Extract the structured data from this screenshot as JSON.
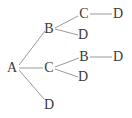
{
  "diagram": {
    "type": "tree",
    "root": "A",
    "colors": {
      "edge": "#9a9a9a",
      "label": "#3a3a3a",
      "background": "#ffffff"
    },
    "nodes": [
      {
        "id": "n_A",
        "label": "A",
        "x": 12,
        "y": 68
      },
      {
        "id": "n_AB",
        "label": "B",
        "x": 49,
        "y": 29
      },
      {
        "id": "n_AC",
        "label": "C",
        "x": 49,
        "y": 68
      },
      {
        "id": "n_AD",
        "label": "D",
        "x": 49,
        "y": 105
      },
      {
        "id": "n_ABC",
        "label": "C",
        "x": 84,
        "y": 14
      },
      {
        "id": "n_ABD",
        "label": "D",
        "x": 83,
        "y": 35
      },
      {
        "id": "n_ACB",
        "label": "B",
        "x": 84,
        "y": 57
      },
      {
        "id": "n_ACD",
        "label": "D",
        "x": 83,
        "y": 77
      },
      {
        "id": "n_ABCD",
        "label": "D",
        "x": 118,
        "y": 14
      },
      {
        "id": "n_ACBD",
        "label": "D",
        "x": 118,
        "y": 57
      }
    ],
    "edges": [
      {
        "from": "n_A",
        "to": "n_AB"
      },
      {
        "from": "n_A",
        "to": "n_AC"
      },
      {
        "from": "n_A",
        "to": "n_AD"
      },
      {
        "from": "n_AB",
        "to": "n_ABC"
      },
      {
        "from": "n_AB",
        "to": "n_ABD"
      },
      {
        "from": "n_AC",
        "to": "n_ACB"
      },
      {
        "from": "n_AC",
        "to": "n_ACD"
      },
      {
        "from": "n_ABC",
        "to": "n_ABCD"
      },
      {
        "from": "n_ACB",
        "to": "n_ACBD"
      }
    ],
    "paths": [
      "A-B-C-D",
      "A-B-D",
      "A-C-B-D",
      "A-C-D",
      "A-D"
    ]
  }
}
